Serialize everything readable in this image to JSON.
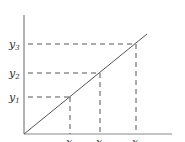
{
  "diagram": {
    "type": "linear-function-graph",
    "axes": {
      "origin": [
        24,
        134
      ],
      "y_axis_top": [
        24,
        15
      ],
      "x_axis_right": [
        172,
        134
      ]
    },
    "line": {
      "from": [
        24,
        134
      ],
      "to": [
        147,
        34
      ]
    },
    "points": [
      {
        "x_label": "x",
        "x_sub": "1",
        "y_label": "y",
        "y_sub": "1",
        "px": 70,
        "py": 97
      },
      {
        "x_label": "x",
        "x_sub": "2",
        "y_label": "y",
        "y_sub": "2",
        "px": 100,
        "py": 73
      },
      {
        "x_label": "x",
        "x_sub": "3",
        "y_label": "y",
        "y_sub": "3",
        "px": 136,
        "py": 44
      }
    ],
    "colors": {
      "line": "#555555",
      "axis": "#666666",
      "dash": "#555555",
      "text": "#333333"
    }
  }
}
